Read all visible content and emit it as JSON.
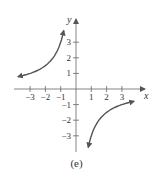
{
  "chart_data": {
    "type": "line",
    "title": "",
    "caption": "(e)",
    "xlabel": "x",
    "ylabel": "y",
    "xlim": [
      -3.9,
      4.5
    ],
    "ylim": [
      -4,
      4.5
    ],
    "x_ticks": [
      -3,
      -2,
      -1,
      1,
      2,
      3
    ],
    "y_ticks": [
      -3,
      -2,
      -1,
      1,
      2,
      3
    ],
    "x_tick_labels": [
      "−3",
      "−2",
      "−1",
      "1",
      "2",
      "3"
    ],
    "y_tick_labels": [
      "−3",
      "−2",
      "−1",
      "1",
      "2",
      "3"
    ],
    "grid": false,
    "series": [
      {
        "name": "left branch",
        "x": [
          -3.8,
          -3,
          -2,
          -1.5,
          -1,
          -0.8
        ],
        "y": [
          0.8,
          0.95,
          1.5,
          2,
          3,
          3.8
        ],
        "arrows": "both"
      },
      {
        "name": "right branch",
        "x": [
          0.8,
          1,
          1.5,
          2,
          3,
          3.8
        ],
        "y": [
          -3.8,
          -3,
          -2,
          -1.5,
          -0.95,
          -0.8
        ],
        "arrows": "both"
      }
    ],
    "color": "#555555"
  }
}
